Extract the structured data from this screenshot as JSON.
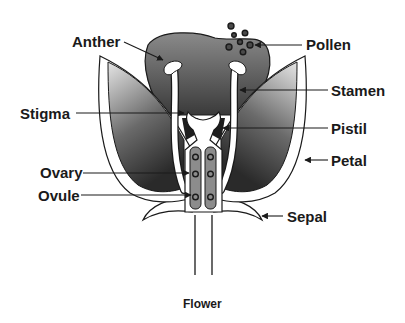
{
  "diagram": {
    "title": "Flower",
    "labels": {
      "anther": "Anther",
      "pollen": "Pollen",
      "stamen": "Stamen",
      "stigma": "Stigma",
      "pistil": "Pistil",
      "petal": "Petal",
      "ovary": "Ovary",
      "ovule": "Ovule",
      "sepal": "Sepal"
    },
    "caption": "Flower",
    "colors": {
      "outline": "#1a1a1a",
      "petal_light": "#d8d8d8",
      "petal_dark": "#2e2e2e",
      "background_mass": "#5a5a5a",
      "ovary_fill": "#8c8c8c",
      "white": "#ffffff"
    }
  }
}
